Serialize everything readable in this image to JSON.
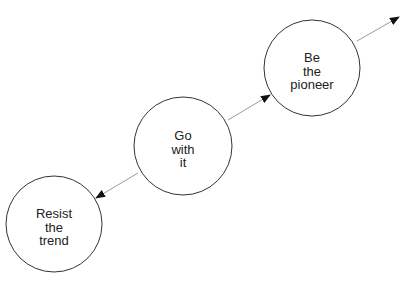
{
  "diagram": {
    "type": "flow",
    "nodes": [
      {
        "id": "resist",
        "lines": [
          "Resist",
          "the",
          "trend"
        ],
        "cx": 54,
        "cy": 224,
        "r": 48
      },
      {
        "id": "go",
        "lines": [
          "Go",
          "with",
          "it"
        ],
        "cx": 183,
        "cy": 146,
        "r": 49
      },
      {
        "id": "pioneer",
        "lines": [
          "Be",
          "the",
          "pioneer"
        ],
        "cx": 312,
        "cy": 68,
        "r": 48
      }
    ],
    "edges": [
      {
        "from": "go",
        "to": "resist"
      },
      {
        "from": "go",
        "to": "pioneer"
      },
      {
        "from": "pioneer",
        "to": "beyond"
      }
    ],
    "colors": {
      "stroke": "#333333",
      "edge": "#9a9a9a",
      "arrowhead": "#111111"
    }
  }
}
